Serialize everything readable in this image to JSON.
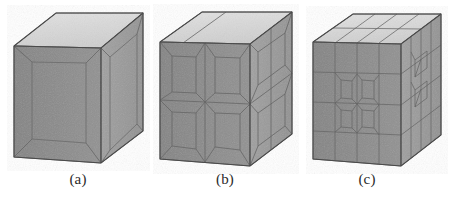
{
  "figure": {
    "kind": "three-panel-3d-mesh-refinement",
    "background_color": "#ffffff",
    "panels": [
      {
        "id": "a",
        "caption": "(a)",
        "description": "coarse hexahedral block mesh, 1 x 1 front subdivision",
        "front_subdivisions_x": 1,
        "front_subdivisions_y": 1,
        "top_subdivisions": 1
      },
      {
        "id": "b",
        "caption": "(b)",
        "description": "once-refined hexahedral block mesh, 2 x 2 front subdivision",
        "front_subdivisions_x": 2,
        "front_subdivisions_y": 2,
        "top_subdivisions": 2
      },
      {
        "id": "c",
        "caption": "(c)",
        "description": "twice-refined hexahedral block mesh, 4 x 4 front subdivision",
        "front_subdivisions_x": 4,
        "front_subdivisions_y": 4,
        "top_subdivisions": 4
      }
    ],
    "colors": {
      "top_face": "#d9d9d9",
      "front_face": "#9a9a9a",
      "side_face": "#8a8a8a",
      "edge_line": "#5c5c5c",
      "mesh_line": "#6b6b6b",
      "outline": "#4a4a4a",
      "caption_text": "#2b2b2b"
    }
  }
}
